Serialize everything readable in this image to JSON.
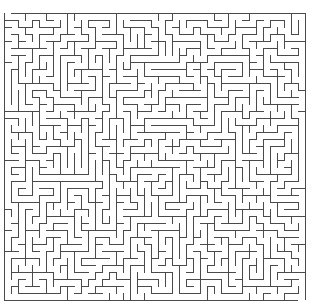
{
  "maze": {
    "cols": 43,
    "rows": 41,
    "cell_size": 7,
    "origin_x": 4,
    "origin_y": 13,
    "wall_color": "#4a4a4a",
    "background_color": "#ffffff",
    "line_width": 1,
    "seed": 90210
  }
}
